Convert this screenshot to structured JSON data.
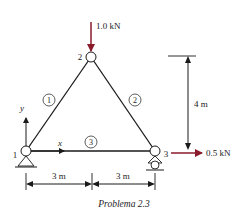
{
  "figure": {
    "caption": "Problema 2.3",
    "nodes": [
      {
        "id": "1",
        "label": "1",
        "x": 26,
        "y": 151,
        "support": "pin"
      },
      {
        "id": "2",
        "label": "2",
        "x": 91,
        "y": 57,
        "support": "none"
      },
      {
        "id": "3",
        "label": "3",
        "x": 155,
        "y": 151,
        "support": "roller"
      }
    ],
    "members": [
      {
        "id": "1",
        "label": "1",
        "from": "1",
        "to": "2"
      },
      {
        "id": "2",
        "label": "2",
        "from": "2",
        "to": "3"
      },
      {
        "id": "3",
        "label": "3",
        "from": "1",
        "to": "3"
      }
    ],
    "loads": [
      {
        "node": "2",
        "label": "1.0 kN",
        "direction": "down",
        "color": "#8b1a2b"
      },
      {
        "node": "3",
        "label": "0.5 kN",
        "direction": "right",
        "color": "#8b1a2b"
      }
    ],
    "dimensions": {
      "height": "4 m",
      "span_left": "3 m",
      "span_right": "3 m"
    },
    "axes": {
      "x": "x",
      "y": "y"
    }
  }
}
